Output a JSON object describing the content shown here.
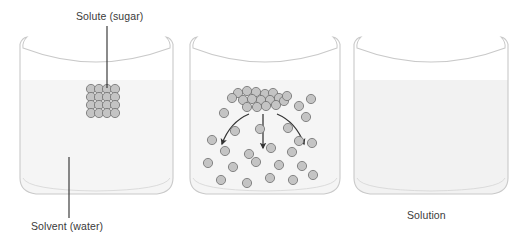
{
  "figure": {
    "title_visible": false,
    "background_color": "#ffffff",
    "width": 518,
    "height": 248
  },
  "labels": {
    "solute": "Solute (sugar)",
    "solvent": "Solvent (water)",
    "solution": "Solution",
    "text_color": "#3a3a3a"
  },
  "colors": {
    "beaker_outline": "#c9c9c9",
    "liquid_fill": "#f5f5f5",
    "liquid_fill_solution": "#f2f2f2",
    "particle_fill": "#c4c4c4",
    "particle_stroke": "#6e6e6e",
    "leader_line": "#2b2b2b",
    "arrow": "#333333"
  },
  "beakers": [
    {
      "id": "beaker-1",
      "name": "solute-in-solvent",
      "stage": "undissolved",
      "x": 18,
      "y": 38,
      "width": 157,
      "height": 158,
      "liquid_level_y": 80,
      "contents": "solid sugar cube suspended in water"
    },
    {
      "id": "beaker-2",
      "name": "dissolving",
      "stage": "dissolving",
      "x": 188,
      "y": 38,
      "width": 154,
      "height": 158,
      "liquid_level_y": 80,
      "contents": "sugar cluster breaking apart, particles dispersing downward"
    },
    {
      "id": "beaker-3",
      "name": "solution",
      "stage": "dissolved",
      "x": 352,
      "y": 38,
      "width": 158,
      "height": 158,
      "liquid_level_y": 80,
      "contents": "uniform homogeneous solution"
    }
  ],
  "sugar_cube": {
    "rows": 4,
    "cols": 4,
    "center_x": 103,
    "center_y": 101,
    "particle_radius": 4.6,
    "spacing": 8.1
  },
  "cluster_beaker2": {
    "particles": [
      [
        238,
        93
      ],
      [
        247,
        91
      ],
      [
        256,
        92
      ],
      [
        265,
        94
      ],
      [
        273,
        93
      ],
      [
        243,
        100
      ],
      [
        252,
        99
      ],
      [
        261,
        100
      ],
      [
        270,
        100
      ],
      [
        279,
        98
      ],
      [
        247,
        107
      ],
      [
        257,
        107
      ],
      [
        266,
        106
      ],
      [
        276,
        105
      ],
      [
        284,
        101
      ],
      [
        232,
        98
      ],
      [
        287,
        96
      ]
    ],
    "radius": 4.6
  },
  "dispersed_beaker2": {
    "particles": [
      [
        224,
        113
      ],
      [
        299,
        106
      ],
      [
        310,
        99
      ],
      [
        306,
        117
      ],
      [
        212,
        140
      ],
      [
        235,
        131
      ],
      [
        260,
        128
      ],
      [
        288,
        128
      ],
      [
        299,
        141
      ],
      [
        225,
        151
      ],
      [
        249,
        152
      ],
      [
        271,
        148
      ],
      [
        292,
        152
      ],
      [
        312,
        143
      ],
      [
        208,
        163
      ],
      [
        233,
        167
      ],
      [
        256,
        162
      ],
      [
        279,
        165
      ],
      [
        302,
        166
      ],
      [
        221,
        180
      ],
      [
        247,
        183
      ],
      [
        270,
        178
      ],
      [
        293,
        180
      ],
      [
        313,
        175
      ],
      [
        238,
        118
      ],
      [
        276,
        120
      ]
    ],
    "radius": 4.6
  },
  "arrows": [
    {
      "name": "arrow-left",
      "type": "curved",
      "from": [
        249,
        112
      ],
      "to": [
        221,
        148
      ]
    },
    {
      "name": "arrow-center",
      "type": "straight",
      "from": [
        263,
        112
      ],
      "to": [
        263,
        152
      ]
    },
    {
      "name": "arrow-right",
      "type": "curved",
      "from": [
        276,
        112
      ],
      "to": [
        305,
        148
      ]
    }
  ],
  "leader_lines": [
    {
      "name": "leader-solute",
      "from": [
        107,
        26
      ],
      "to": [
        107,
        90
      ]
    },
    {
      "name": "leader-solvent",
      "from": [
        69,
        157
      ],
      "to": [
        69,
        218
      ]
    }
  ]
}
